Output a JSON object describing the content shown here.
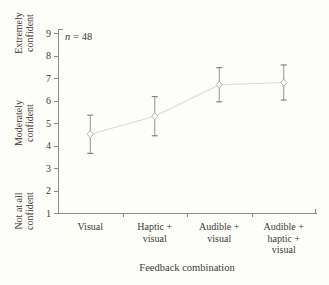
{
  "figure": {
    "annotation": {
      "var": "n",
      "value": "= 48"
    },
    "y_axis": {
      "tick_labels": [
        "1",
        "2",
        "3",
        "4",
        "5",
        "6",
        "7",
        "8",
        "9"
      ],
      "region_labels": [
        {
          "text": "Extremely\nconfident",
          "at_value": 9
        },
        {
          "text": "Moderately\nconfident",
          "at_value": 5
        },
        {
          "text": "Not at all\nconfident",
          "at_value": 1
        }
      ]
    },
    "x_axis": {
      "title": "Feedback combination"
    },
    "colors": {
      "background": "#fdfdfa",
      "axis": "#8b8b85",
      "text": "#3d3b35",
      "series_line": "#dcdcd3",
      "marker_stroke": "#b9b9b1",
      "marker_fill": "#fdfdfa",
      "error_bar": "#95958f",
      "error_cap": "#6e6e68"
    }
  },
  "chart_data": {
    "type": "line",
    "categories": [
      "Visual",
      "Haptic +\nvisual",
      "Audible +\nvisual",
      "Audible +\nhaptic +\nvisual"
    ],
    "values": [
      4.5,
      5.3,
      6.7,
      6.8
    ],
    "errors": [
      0.85,
      0.87,
      0.76,
      0.78
    ],
    "title": "",
    "xlabel": "Feedback combination",
    "ylabel": "Confidence rating",
    "ylim": [
      1,
      9
    ],
    "y_region_labels": [
      "Not at all confident (at 1)",
      "Moderately confident (at 5)",
      "Extremely confident (at 9)"
    ],
    "annotation": "n = 48",
    "marker": "open-diamond",
    "legend": "none",
    "grid": false
  }
}
